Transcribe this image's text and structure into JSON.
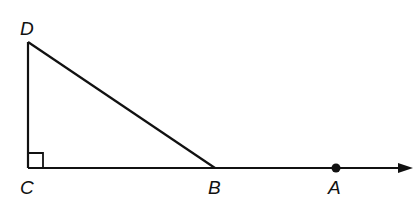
{
  "diagram": {
    "type": "geometry",
    "points": {
      "D": {
        "label": "D",
        "x": 28,
        "y": 42
      },
      "C": {
        "label": "C",
        "x": 28,
        "y": 168
      },
      "B": {
        "label": "B",
        "x": 215,
        "y": 168
      },
      "A": {
        "label": "A",
        "x": 336,
        "y": 168
      }
    },
    "segments": [
      "DC",
      "DB",
      "CB"
    ],
    "ray": {
      "from": "C",
      "through": "A",
      "arrow": true
    },
    "right_angle_at": "C",
    "colors": {
      "stroke": "#111111",
      "background": "#ffffff"
    }
  }
}
